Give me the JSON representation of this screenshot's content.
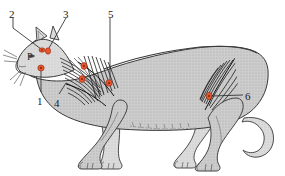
{
  "figure": {
    "kind": "anatomical-illustration",
    "orientation": "facing-left",
    "background_color": "#ffffff",
    "body_fill": "#c9c9c9",
    "body_fill_light": "#d8d8d8",
    "outline_color": "#3a3a3a",
    "muscle_hatch_color": "#242424",
    "marker_color": "#e8562f",
    "marker_stroke": "#8f2d12",
    "leader_color": "#2a2a2a",
    "label_color": "#1a1a1a"
  },
  "labels": [
    {
      "id": "label-1",
      "text": "1",
      "x": 37,
      "y": 96,
      "target": "cheek-point"
    },
    {
      "id": "label-2",
      "text": "2",
      "x": 9,
      "y": 9,
      "target": "ear-base-point"
    },
    {
      "id": "label-3",
      "text": "3",
      "x": 63,
      "y": 9,
      "target": "head-point"
    },
    {
      "id": "label-4",
      "text": "4",
      "x": 54,
      "y": 98,
      "target": "shoulder-fibers"
    },
    {
      "id": "label-5",
      "text": "5",
      "x": 108,
      "y": 9,
      "target": "shoulder-point"
    },
    {
      "id": "label-6",
      "text": "6",
      "x": 245,
      "y": 91,
      "target": "hindlimb-point"
    }
  ],
  "annotations": [
    {
      "id": "annotation-p",
      "text": "P",
      "x": 27,
      "y": 51
    }
  ],
  "markers": [
    {
      "id": "marker-ear-base",
      "cx": 42,
      "cy": 50,
      "rx": 3.0,
      "ry": 2.2
    },
    {
      "id": "marker-head",
      "cx": 48,
      "cy": 51,
      "rx": 2.6,
      "ry": 3.2
    },
    {
      "id": "marker-cheek",
      "cx": 41,
      "cy": 68,
      "rx": 3.2,
      "ry": 3.0
    },
    {
      "id": "marker-scapula-1",
      "cx": 84,
      "cy": 66,
      "rx": 3.0,
      "ry": 3.4
    },
    {
      "id": "marker-scapula-2",
      "cx": 82,
      "cy": 79,
      "rx": 3.0,
      "ry": 3.4
    },
    {
      "id": "marker-shoulder",
      "cx": 109,
      "cy": 83,
      "rx": 3.2,
      "ry": 3.2
    },
    {
      "id": "marker-hindlimb",
      "cx": 209,
      "cy": 96,
      "rx": 2.8,
      "ry": 3.6
    }
  ],
  "leaders": [
    {
      "id": "leader-2",
      "path": "M13,18 L13,28 L41,49"
    },
    {
      "id": "leader-3",
      "path": "M66,18 L49,48"
    },
    {
      "id": "leader-1",
      "path": "M41,92 L41,71"
    },
    {
      "id": "leader-4",
      "path": "M59,94 L66,83"
    },
    {
      "id": "leader-5",
      "path": "M110,18 L110,80"
    },
    {
      "id": "leader-6",
      "path": "M243,95 L212,96"
    }
  ]
}
